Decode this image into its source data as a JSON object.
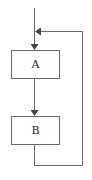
{
  "diagram": {
    "type": "flowchart-loop",
    "nodes": [
      {
        "id": "A",
        "label": "A"
      },
      {
        "id": "B",
        "label": "B"
      }
    ],
    "edges": [
      {
        "from": "entry",
        "to": "A"
      },
      {
        "from": "A",
        "to": "B"
      },
      {
        "from": "B",
        "to": "A",
        "kind": "feedback-loop"
      }
    ],
    "colors": {
      "line": "#6a6a6a",
      "box_stroke": "#6a6a6a",
      "text": "#222222",
      "background": "#ffffff"
    }
  }
}
